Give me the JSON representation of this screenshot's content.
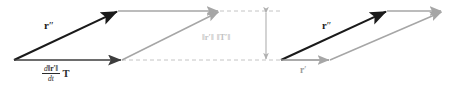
{
  "figure": {
    "width": 454,
    "height": 88,
    "background_color": "#ffffff"
  },
  "colors": {
    "black_vector": "#1a1a1a",
    "dark_gray_vector": "#3d3d3d",
    "gray_vector": "#a6a6a6",
    "light_gray_text": "#c3c3c3",
    "dashed_guide": "#b5b5b5",
    "bracket_arrow": "#b0b0b0"
  },
  "labels": {
    "r_double_prime_left": {
      "base": "r",
      "prime": "″",
      "full": "r″",
      "color": "#1a1a1a"
    },
    "derivative_tangent": {
      "numerator_d": "d",
      "numerator_norm": "‖r′‖",
      "denominator": "dt",
      "tangent": "T",
      "full": "d‖r′‖/dt T",
      "color": "#2b2b2b"
    },
    "norms_product": {
      "first": "‖r′‖",
      "second": "‖T′‖",
      "full": "‖r′‖ ‖T′‖",
      "color": "#c3c3c3"
    },
    "r_double_prime_right": {
      "base": "r",
      "prime": "″",
      "full": "r″",
      "color": "#1a1a1a"
    },
    "r_prime_right": {
      "base": "r",
      "prime": "′",
      "full": "r′",
      "color": "#9a9a9a"
    }
  },
  "geometry": {
    "left_parallelogram": {
      "origin": [
        14,
        60
      ],
      "black_diagonal_tip": [
        118,
        11
      ],
      "black_horizontal_tip": [
        122,
        60
      ],
      "gray_top_tip": [
        220,
        11
      ],
      "gray_diagonal_from": [
        122,
        60
      ],
      "gray_diagonal_tip": [
        220,
        11
      ]
    },
    "right_parallelogram": {
      "origin": [
        281,
        60
      ],
      "black_diagonal_tip": [
        387,
        11
      ],
      "gray_horizontal_tip": [
        330,
        60
      ],
      "gray_top_tip": [
        443,
        11
      ],
      "gray_diagonal_from": [
        330,
        60
      ],
      "gray_diagonal_tip": [
        443,
        11
      ]
    },
    "measure_bracket": {
      "x": 266,
      "y_top": 11,
      "y_bottom": 61,
      "double_headed": true
    },
    "dashed_guides": [
      {
        "from": [
          122,
          60
        ],
        "to": [
          281,
          60
        ]
      },
      {
        "from": [
          220,
          11
        ],
        "to": [
          281,
          11
        ]
      }
    ]
  }
}
